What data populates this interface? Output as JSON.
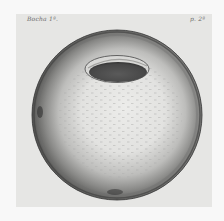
{
  "plate": {
    "caption_left": "Bocha 1ª.",
    "caption_right": "p. 2ª",
    "subject": "engraved sphere with elliptical opening",
    "colors": {
      "paper": "#f8f8f8",
      "plate_background": "#e6e6e4",
      "sphere_highlight": "#e9e9e7",
      "sphere_shadow": "#4a4a4a",
      "opening_interior": "#505050",
      "opening_rim": "#dcdcda"
    }
  }
}
